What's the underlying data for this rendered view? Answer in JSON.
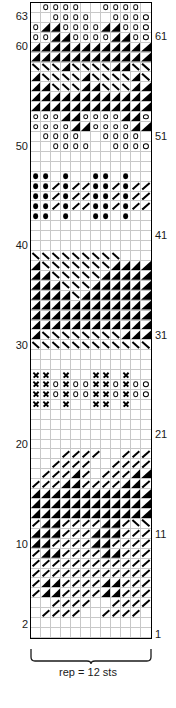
{
  "chart": {
    "columns": 12,
    "rows": 64,
    "repeat_caption": "rep = 12 sts",
    "row_labels_left": [
      "63",
      "60",
      "50",
      "40",
      "30",
      "20",
      "10",
      "2"
    ],
    "row_labels_right": [
      "61",
      "51",
      "41",
      "31",
      "21",
      "11",
      "1"
    ],
    "symbol_legend": {
      "o": "yarn-over-open-circle",
      "x": "cross-symbol",
      "b": "bobble-filled-dot",
      "r": "right-slant-line",
      "l": "left-slant-line",
      "tl": "filled-lower-left-triangle",
      "tr": "filled-lower-right-triangle",
      "tul": "filled-upper-left-triangle",
      "tur": "filled-upper-right-triangle",
      ".": "empty-knit-stitch"
    },
    "colors": {
      "symbol": "#000000",
      "grid_line": "#c8c8c8",
      "border": "#000000",
      "background": "#ffffff",
      "label_text": "#1a1a1a"
    }
  },
  "chart_data": {
    "type": "heatmap",
    "xlabel": "rep = 12 sts",
    "ylabel": "row number",
    "categories": [
      "1",
      "2",
      "3",
      "4",
      "5",
      "6",
      "7",
      "8",
      "9",
      "10",
      "11",
      "12"
    ],
    "legend_position": "none",
    "grid": true,
    "rows_top_to_bottom": [
      {
        "row": 64,
        "cells": [
          ".",
          "o",
          "o",
          "o",
          "o",
          ".",
          ".",
          "o",
          "o",
          "o",
          "o",
          "."
        ]
      },
      {
        "row": 63,
        "cells": [
          ".",
          ".",
          "o",
          "o",
          "o",
          "o",
          ".",
          ".",
          "o",
          "o",
          "o",
          "o"
        ]
      },
      {
        "row": 62,
        "cells": [
          "o",
          "tr",
          "tr",
          "o",
          "o",
          "o",
          "o",
          "tr",
          "tr",
          "o",
          "o",
          "o"
        ]
      },
      {
        "row": 61,
        "cells": [
          "o",
          "o",
          "tr",
          "tr",
          "o",
          "o",
          "o",
          "o",
          "tr",
          "tr",
          "o",
          "o"
        ]
      },
      {
        "row": 60,
        "cells": [
          "tr",
          "tr",
          "tr",
          "tr",
          "tr",
          "tr",
          "tr",
          "tr",
          "tr",
          "tr",
          "tr",
          "tr"
        ]
      },
      {
        "row": 59,
        "cells": [
          "tr",
          "tr",
          "tr",
          "tr",
          "tr",
          "tr",
          "tr",
          "tr",
          "tr",
          "tr",
          "tr",
          "tr"
        ]
      },
      {
        "row": 58,
        "cells": [
          "l",
          "l",
          "l",
          "tr",
          "l",
          "l",
          "l",
          "l",
          "tr",
          "tr",
          "l",
          "l"
        ]
      },
      {
        "row": 57,
        "cells": [
          "tr",
          "l",
          "l",
          "l",
          "l",
          "tr",
          "l",
          "l",
          "l",
          "l",
          "tr",
          "l"
        ]
      },
      {
        "row": 56,
        "cells": [
          "tr",
          "tr",
          "l",
          "l",
          "l",
          "tr",
          "tr",
          "l",
          "l",
          "l",
          "tr",
          "tr"
        ]
      },
      {
        "row": 55,
        "cells": [
          "tr",
          "tr",
          "tr",
          "tr",
          "tr",
          "tr",
          "tr",
          "tr",
          "tr",
          "tr",
          "tr",
          "tr"
        ]
      },
      {
        "row": 54,
        "cells": [
          "tr",
          "tr",
          "tr",
          "tr",
          "tr",
          "tr",
          "tr",
          "tr",
          "tr",
          "tr",
          "tr",
          "tr"
        ]
      },
      {
        "row": 53,
        "cells": [
          "o",
          "o",
          "o",
          "tr",
          "tr",
          "o",
          "o",
          "o",
          "o",
          "tr",
          "tr",
          "o"
        ]
      },
      {
        "row": 52,
        "cells": [
          "o",
          "o",
          "o",
          "o",
          "tr",
          "tr",
          "o",
          "o",
          "o",
          "o",
          "tr",
          "tr"
        ]
      },
      {
        "row": 51,
        "cells": [
          ".",
          "o",
          "o",
          "o",
          "o",
          ".",
          ".",
          "o",
          "o",
          "o",
          "o",
          "."
        ]
      },
      {
        "row": 50,
        "cells": [
          ".",
          ".",
          "o",
          "o",
          "o",
          "o",
          ".",
          ".",
          "o",
          "o",
          "o",
          "o"
        ]
      },
      {
        "row": 49,
        "cells": [
          ".",
          ".",
          ".",
          ".",
          ".",
          ".",
          ".",
          ".",
          ".",
          ".",
          ".",
          "."
        ]
      },
      {
        "row": 48,
        "cells": [
          ".",
          ".",
          ".",
          ".",
          ".",
          ".",
          ".",
          ".",
          ".",
          ".",
          ".",
          "."
        ]
      },
      {
        "row": 47,
        "cells": [
          "b",
          "b",
          ".",
          "b",
          ".",
          ".",
          "b",
          "b",
          ".",
          "b",
          ".",
          "."
        ]
      },
      {
        "row": 46,
        "cells": [
          "b",
          "b",
          "r",
          "b",
          "r",
          "r",
          "b",
          "b",
          "r",
          "b",
          "r",
          "r"
        ]
      },
      {
        "row": 45,
        "cells": [
          "b",
          "b",
          "r",
          "b",
          "r",
          "r",
          "b",
          "b",
          "r",
          "b",
          "r",
          "r"
        ]
      },
      {
        "row": 44,
        "cells": [
          "b",
          "b",
          "r",
          "b",
          "r",
          "r",
          "b",
          "b",
          "r",
          "b",
          "r",
          "r"
        ]
      },
      {
        "row": 43,
        "cells": [
          "b",
          "b",
          ".",
          "b",
          ".",
          ".",
          "b",
          "b",
          ".",
          "b",
          ".",
          "."
        ]
      },
      {
        "row": 42,
        "cells": [
          ".",
          ".",
          ".",
          ".",
          ".",
          ".",
          ".",
          ".",
          ".",
          ".",
          ".",
          "."
        ]
      },
      {
        "row": 41,
        "cells": [
          ".",
          ".",
          ".",
          ".",
          ".",
          ".",
          ".",
          ".",
          ".",
          ".",
          ".",
          "."
        ]
      },
      {
        "row": 40,
        "cells": [
          ".",
          ".",
          ".",
          ".",
          ".",
          ".",
          ".",
          ".",
          ".",
          ".",
          ".",
          "."
        ]
      },
      {
        "row": 39,
        "cells": [
          "l",
          "l",
          "l",
          "l",
          "l",
          "l",
          "l",
          "l",
          "l",
          ".",
          ".",
          "."
        ]
      },
      {
        "row": 38,
        "cells": [
          "tr",
          "l",
          "l",
          "l",
          "l",
          "l",
          "l",
          "l",
          "tr",
          "tr",
          "tr",
          "tr"
        ]
      },
      {
        "row": 37,
        "cells": [
          "tr",
          "tr",
          "l",
          "l",
          "l",
          "l",
          "l",
          "tr",
          "tr",
          "tr",
          "tr",
          "tr"
        ]
      },
      {
        "row": 36,
        "cells": [
          "tr",
          "tr",
          "tr",
          "l",
          "l",
          "l",
          "tr",
          "tr",
          "tr",
          "tr",
          "tr",
          "tr"
        ]
      },
      {
        "row": 35,
        "cells": [
          "tr",
          "tr",
          "tr",
          "tr",
          "l",
          "tr",
          "tr",
          "tr",
          "tr",
          "tr",
          "tr",
          "tr"
        ]
      },
      {
        "row": 34,
        "cells": [
          "tr",
          "tr",
          "tr",
          "tr",
          "tr",
          "tr",
          "tr",
          "tr",
          "tr",
          "tr",
          "tr",
          "tr"
        ]
      },
      {
        "row": 33,
        "cells": [
          "tr",
          "tr",
          "tr",
          "tr",
          "tr",
          "tr",
          "tr",
          "tr",
          "tr",
          "tr",
          "tr",
          "tr"
        ]
      },
      {
        "row": 32,
        "cells": [
          "tr",
          "tr",
          "tr",
          "tr",
          "tr",
          "tr",
          "tr",
          "tr",
          "tr",
          "tr",
          "tr",
          "tr"
        ]
      },
      {
        "row": 31,
        "cells": [
          "tr",
          "l",
          "l",
          "l",
          "l",
          "l",
          "l",
          "l",
          "l",
          "tr",
          "tr",
          "tr"
        ]
      },
      {
        "row": 30,
        "cells": [
          "l",
          "l",
          "l",
          "l",
          "l",
          "l",
          "l",
          "l",
          "l",
          "l",
          "l",
          "l"
        ]
      },
      {
        "row": 29,
        "cells": [
          ".",
          ".",
          ".",
          ".",
          ".",
          ".",
          ".",
          ".",
          ".",
          ".",
          ".",
          "."
        ]
      },
      {
        "row": 28,
        "cells": [
          ".",
          ".",
          ".",
          ".",
          ".",
          ".",
          ".",
          ".",
          ".",
          ".",
          ".",
          "."
        ]
      },
      {
        "row": 27,
        "cells": [
          "x",
          "x",
          ".",
          "x",
          ".",
          ".",
          "x",
          "x",
          ".",
          "x",
          ".",
          "."
        ]
      },
      {
        "row": 26,
        "cells": [
          "x",
          "x",
          "o",
          "x",
          "o",
          "o",
          "x",
          "x",
          "o",
          "x",
          "o",
          "o"
        ]
      },
      {
        "row": 25,
        "cells": [
          "x",
          "x",
          "o",
          "x",
          "o",
          "o",
          "x",
          "x",
          "o",
          "x",
          "o",
          "o"
        ]
      },
      {
        "row": 24,
        "cells": [
          "x",
          "x",
          ".",
          "x",
          ".",
          ".",
          "x",
          "x",
          ".",
          "x",
          ".",
          "."
        ]
      },
      {
        "row": 23,
        "cells": [
          ".",
          ".",
          ".",
          ".",
          ".",
          ".",
          ".",
          ".",
          ".",
          ".",
          ".",
          "."
        ]
      },
      {
        "row": 22,
        "cells": [
          ".",
          ".",
          ".",
          ".",
          ".",
          ".",
          ".",
          ".",
          ".",
          ".",
          ".",
          "."
        ]
      },
      {
        "row": 21,
        "cells": [
          ".",
          ".",
          ".",
          ".",
          ".",
          ".",
          ".",
          ".",
          ".",
          ".",
          ".",
          "."
        ]
      },
      {
        "row": 20,
        "cells": [
          ".",
          ".",
          ".",
          ".",
          ".",
          ".",
          ".",
          ".",
          ".",
          ".",
          ".",
          "."
        ]
      },
      {
        "row": 19,
        "cells": [
          ".",
          ".",
          ".",
          "r",
          "r",
          "r",
          "r",
          ".",
          ".",
          "r",
          "r",
          "r"
        ]
      },
      {
        "row": 18,
        "cells": [
          ".",
          ".",
          "r",
          "r",
          "r",
          "r",
          ".",
          ".",
          "r",
          "r",
          "r",
          "r"
        ]
      },
      {
        "row": 17,
        "cells": [
          ".",
          "r",
          "r",
          "r",
          "tr",
          "r",
          ".",
          "r",
          "r",
          "r",
          "tr",
          "tr"
        ]
      },
      {
        "row": 16,
        "cells": [
          "r",
          "r",
          "r",
          "tr",
          "tr",
          "r",
          "r",
          "r",
          "r",
          "tr",
          "tr",
          "r"
        ]
      },
      {
        "row": 15,
        "cells": [
          "tr",
          "tr",
          "tr",
          "tr",
          "tr",
          "tr",
          "tr",
          "tr",
          "tr",
          "tr",
          "tr",
          "tr"
        ]
      },
      {
        "row": 14,
        "cells": [
          "tr",
          "tr",
          "tr",
          "tr",
          "tr",
          "tr",
          "tr",
          "tr",
          "tr",
          "tr",
          "tr",
          "tr"
        ]
      },
      {
        "row": 13,
        "cells": [
          "tr",
          "tr",
          "tr",
          "tr",
          "tr",
          "tr",
          "tr",
          "tr",
          "tr",
          "tr",
          "tr",
          "tr"
        ]
      },
      {
        "row": 12,
        "cells": [
          "r",
          "tr",
          "tr",
          "r",
          "r",
          "r",
          "r",
          "tr",
          "tr",
          "r",
          "l",
          "l"
        ]
      },
      {
        "row": 11,
        "cells": [
          "tr",
          "tr",
          "tr",
          "r",
          "r",
          "r",
          "tr",
          "tr",
          "tr",
          "r",
          "r",
          "r"
        ]
      },
      {
        "row": 10,
        "cells": [
          "tr",
          "tr",
          "r",
          "r",
          "r",
          "r",
          "tr",
          "tr",
          "r",
          "r",
          "r",
          "r"
        ]
      },
      {
        "row": 9,
        "cells": [
          "r",
          "tr",
          "tr",
          "r",
          "r",
          "r",
          "r",
          "tr",
          "tr",
          "r",
          "r",
          "r"
        ]
      },
      {
        "row": 8,
        "cells": [
          "r",
          "r",
          "r",
          "r",
          "r",
          "r",
          "r",
          "r",
          "r",
          "r",
          "r",
          "r"
        ]
      },
      {
        "row": 7,
        "cells": [
          "r",
          "r",
          "r",
          "r",
          "r",
          "r",
          "r",
          "r",
          "r",
          "r",
          "r",
          "r"
        ]
      },
      {
        "row": 6,
        "cells": [
          "r",
          "tr",
          "tr",
          "r",
          "r",
          "r",
          "r",
          "tr",
          "tr",
          "r",
          "r",
          "r"
        ]
      },
      {
        "row": 5,
        "cells": [
          "r",
          "tr",
          "tr",
          "r",
          "r",
          "r",
          "r",
          "tr",
          "tr",
          "r",
          "r",
          "r"
        ]
      },
      {
        "row": 4,
        "cells": [
          ".",
          ".",
          "r",
          "r",
          "r",
          "r",
          ".",
          ".",
          "r",
          "r",
          "r",
          "r"
        ]
      },
      {
        "row": 3,
        "cells": [
          ".",
          "r",
          "r",
          "r",
          "r",
          ".",
          ".",
          "r",
          "r",
          "r",
          "r",
          "."
        ]
      },
      {
        "row": 2,
        "cells": [
          ".",
          ".",
          ".",
          ".",
          ".",
          ".",
          ".",
          ".",
          ".",
          ".",
          ".",
          "."
        ]
      },
      {
        "row": 1,
        "cells": [
          ".",
          ".",
          ".",
          ".",
          ".",
          ".",
          ".",
          ".",
          ".",
          ".",
          ".",
          "."
        ]
      }
    ],
    "row_number_markers": {
      "left": [
        {
          "label": "63",
          "row": 63
        },
        {
          "label": "60",
          "row": 60
        },
        {
          "label": "50",
          "row": 50
        },
        {
          "label": "40",
          "row": 40
        },
        {
          "label": "30",
          "row": 30
        },
        {
          "label": "20",
          "row": 20
        },
        {
          "label": "10",
          "row": 10
        },
        {
          "label": "2",
          "row": 2
        }
      ],
      "right": [
        {
          "label": "61",
          "row": 61
        },
        {
          "label": "51",
          "row": 51
        },
        {
          "label": "41",
          "row": 41
        },
        {
          "label": "31",
          "row": 31
        },
        {
          "label": "21",
          "row": 21
        },
        {
          "label": "11",
          "row": 11
        },
        {
          "label": "1",
          "row": 1
        }
      ]
    }
  }
}
